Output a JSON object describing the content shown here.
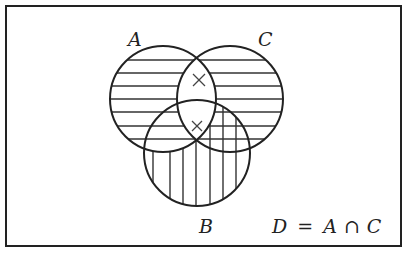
{
  "diagram": {
    "type": "venn",
    "sets": [
      {
        "name": "A",
        "label": "A",
        "cx": 163,
        "cy": 99,
        "r": 53
      },
      {
        "name": "C",
        "label": "C",
        "cx": 230,
        "cy": 99,
        "r": 53
      },
      {
        "name": "B",
        "label": "B",
        "cx": 197,
        "cy": 153,
        "r": 53
      }
    ],
    "equation": {
      "lhs": "D",
      "eq": "=",
      "a": "A",
      "op": "∩",
      "c": "C"
    },
    "marks": [
      {
        "symbol": "×",
        "region": "A∩C only",
        "x": 199,
        "y": 80
      },
      {
        "symbol": "×",
        "region": "A∩B∩C",
        "x": 197,
        "y": 126
      }
    ],
    "hatching": {
      "horizontal": "A ∪ C (shaded)",
      "vertical": "B minus A (shaded)"
    },
    "colors": {
      "ink": "#222222",
      "background": "#ffffff"
    }
  }
}
